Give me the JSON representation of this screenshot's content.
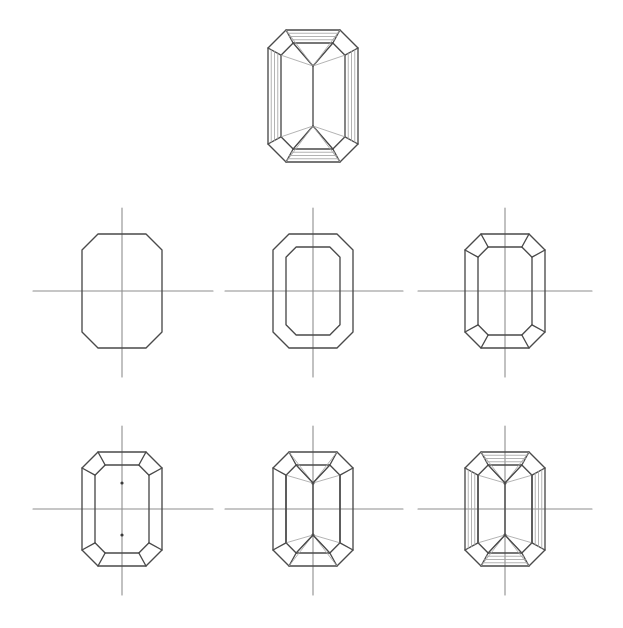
{
  "document": {
    "title": "Emerald Cut Gemstone — Step-by-Step Construction Diagram",
    "subject": "emerald-cut gem",
    "background_color": "#ffffff",
    "ink_color": "#4a4a4a",
    "ink_color_light": "#9a9a9a",
    "canvas": {
      "width": 623,
      "height": 628
    }
  },
  "figures": [
    {
      "id": "finished-gem",
      "name": "finished-emerald-cut-gem",
      "label": "Finished emerald cut gem",
      "row": 0,
      "column": 1,
      "center": {
        "x": 313,
        "y": 96
      },
      "has_axes": false,
      "half_width": 45,
      "half_height": 66,
      "corner_cut": 18,
      "table_inset": 13,
      "apex_offset": 30,
      "step_lines": 3,
      "description": "Completed rendering with outer octagon, stepped table facets, corner facets and radiating pavilion lines"
    },
    {
      "id": "step-1",
      "name": "construction-step-1",
      "label": "Step 1 — outline octagon",
      "row": 1,
      "column": 0,
      "center": {
        "x": 122,
        "y": 291
      },
      "has_axes": true,
      "axis_h": {
        "x1": 33,
        "x2": 213
      },
      "axis_v": {
        "y1": 208,
        "y2": 377
      },
      "half_width": 40,
      "half_height": 57,
      "corner_cut": 16,
      "show_outer": true,
      "show_table": false,
      "show_corner_facets": false,
      "show_dots": false,
      "show_rays": false,
      "show_steps": false
    },
    {
      "id": "step-2",
      "name": "construction-step-2",
      "label": "Step 2 — add inner table octagon",
      "row": 1,
      "column": 1,
      "center": {
        "x": 313,
        "y": 291
      },
      "has_axes": true,
      "axis_h": {
        "x1": 225,
        "x2": 403
      },
      "axis_v": {
        "y1": 208,
        "y2": 377
      },
      "half_width": 40,
      "half_height": 57,
      "corner_cut": 16,
      "table_inset": 13,
      "show_outer": true,
      "show_table": true,
      "show_corner_facets": false,
      "show_dots": false,
      "show_rays": false,
      "show_steps": false
    },
    {
      "id": "step-3",
      "name": "construction-step-3",
      "label": "Step 3 — connect corner facets",
      "row": 1,
      "column": 2,
      "center": {
        "x": 505,
        "y": 291
      },
      "has_axes": true,
      "axis_h": {
        "x1": 418,
        "x2": 592
      },
      "axis_v": {
        "y1": 208,
        "y2": 377
      },
      "half_width": 40,
      "half_height": 57,
      "corner_cut": 16,
      "table_inset": 13,
      "show_outer": true,
      "show_table": true,
      "show_corner_facets": true,
      "show_dots": false,
      "show_rays": false,
      "show_steps": false
    },
    {
      "id": "step-4",
      "name": "construction-step-4",
      "label": "Step 4 — mark apex points on vertical axis",
      "row": 2,
      "column": 0,
      "center": {
        "x": 122,
        "y": 509
      },
      "has_axes": true,
      "axis_h": {
        "x1": 33,
        "x2": 213
      },
      "axis_v": {
        "y1": 426,
        "y2": 595
      },
      "half_width": 40,
      "half_height": 57,
      "corner_cut": 16,
      "table_inset": 13,
      "apex_offset": 26,
      "show_outer": true,
      "show_table": true,
      "show_corner_facets": true,
      "show_dots": true,
      "show_rays": false,
      "show_steps": false
    },
    {
      "id": "step-5",
      "name": "construction-step-5",
      "label": "Step 5 — draw pavilion rays from apex points",
      "row": 2,
      "column": 1,
      "center": {
        "x": 313,
        "y": 509
      },
      "has_axes": true,
      "axis_h": {
        "x1": 225,
        "x2": 403
      },
      "axis_v": {
        "y1": 426,
        "y2": 595
      },
      "half_width": 40,
      "half_height": 57,
      "corner_cut": 16,
      "table_inset": 13,
      "apex_offset": 26,
      "show_outer": true,
      "show_table": true,
      "show_corner_facets": true,
      "show_dots": true,
      "show_rays": true,
      "show_steps": false
    },
    {
      "id": "step-6",
      "name": "construction-step-6",
      "label": "Step 6 — add stepped facet lines",
      "row": 2,
      "column": 2,
      "center": {
        "x": 505,
        "y": 509
      },
      "has_axes": true,
      "axis_h": {
        "x1": 418,
        "x2": 592
      },
      "axis_v": {
        "y1": 426,
        "y2": 595
      },
      "half_width": 40,
      "half_height": 57,
      "corner_cut": 16,
      "table_inset": 13,
      "apex_offset": 26,
      "show_outer": true,
      "show_table": true,
      "show_corner_facets": true,
      "show_dots": true,
      "show_rays": true,
      "show_steps": true,
      "step_lines": 3
    }
  ],
  "style": {
    "stroke_main": "#4a4a4a",
    "stroke_axis": "#8e8e8e",
    "stroke_light": "#a5a5a5",
    "stroke_width_main": 1.35,
    "stroke_width_axis": 1.1,
    "stroke_width_light": 0.85,
    "dot_radius": 1.6,
    "dot_color": "#3a3a3a"
  }
}
